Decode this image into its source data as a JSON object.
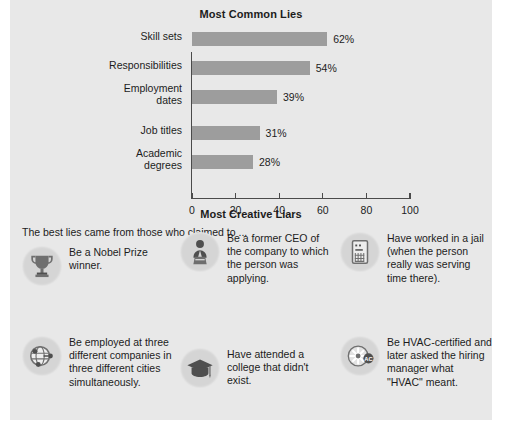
{
  "chart_data": {
    "type": "bar",
    "orientation": "horizontal",
    "title": "Most Common Lies",
    "categories": [
      "Skill sets",
      "Responsibilities",
      "Employment dates",
      "Job titles",
      "Academic degrees"
    ],
    "values": [
      62,
      54,
      39,
      31,
      28
    ],
    "value_labels": [
      "62%",
      "54%",
      "39%",
      "31%",
      "28%"
    ],
    "xlabel": "",
    "ylabel": "",
    "xlim": [
      0,
      100
    ],
    "xticks": [
      0,
      20,
      40,
      60,
      80,
      100
    ],
    "xtick_labels": [
      "0",
      "20",
      "40",
      "60",
      "80",
      "100"
    ],
    "grid": false,
    "legend": false,
    "bar_color": "#9d9d9d",
    "axis_color": "#4a4a4a"
  },
  "chart": {
    "title": "Most Common Lies",
    "rows": [
      {
        "label_line1": "Skill sets",
        "label_line2": "",
        "value": 62,
        "value_label": "62%"
      },
      {
        "label_line1": "Responsibilities",
        "label_line2": "",
        "value": 54,
        "value_label": "54%"
      },
      {
        "label_line1": "Employment",
        "label_line2": "dates",
        "value": 39,
        "value_label": "39%"
      },
      {
        "label_line1": "Job titles",
        "label_line2": "",
        "value": 31,
        "value_label": "31%"
      },
      {
        "label_line1": "Academic",
        "label_line2": "degrees",
        "value": 28,
        "value_label": "28%"
      }
    ],
    "xticks": [
      {
        "label": "0"
      },
      {
        "label": "20"
      },
      {
        "label": "40"
      },
      {
        "label": "60"
      },
      {
        "label": "80"
      },
      {
        "label": "100"
      }
    ]
  },
  "creative": {
    "title": "Most Creative Liars",
    "subtitle": "The best lies came from those who claimed to ...",
    "items": [
      {
        "icon": "trophy-icon",
        "text": "Be a Nobel Prize winner."
      },
      {
        "icon": "speaker-podium-icon",
        "text": "Be a former CEO of the company to which the person was applying."
      },
      {
        "icon": "jail-window-icon",
        "text": "Have worked in a jail (when the person really was serving time there)."
      },
      {
        "icon": "globe-network-icon",
        "text": "Be employed at three different companies in three different cities simultaneously."
      },
      {
        "icon": "graduation-cap-icon",
        "text": "Have attended a college that didn't exist."
      },
      {
        "icon": "air-conditioner-icon",
        "text": "Be HVAC-certified and later asked the hiring manager what \"HVAC\" meant."
      }
    ]
  },
  "footer": {
    "source": ""
  },
  "colors": {
    "panel_background": "#e8e8e8",
    "bar": "#9d9d9d",
    "icon_circle": "#d5d5d5",
    "text": "#1c1c1c"
  }
}
